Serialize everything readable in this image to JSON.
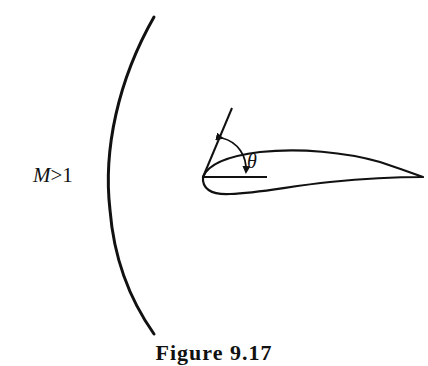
{
  "figure": {
    "caption": "Figure 9.17",
    "mach_label_symbol": "M",
    "mach_label_relation": ">1",
    "angle_label": "θ"
  },
  "elements": {
    "shock_wave": "curved detached bow shock (left of airfoil)",
    "airfoil": "cambered airfoil section with rounded leading edge and sharp trailing edge",
    "tangent_line": "line tangent to airfoil at leading edge",
    "chord_reference_line": "short horizontal reference line from leading edge",
    "angle_arc": "double-headed arc arrow between tangent line and horizontal reference"
  },
  "colors": {
    "stroke": "#111111",
    "background": "#ffffff"
  }
}
